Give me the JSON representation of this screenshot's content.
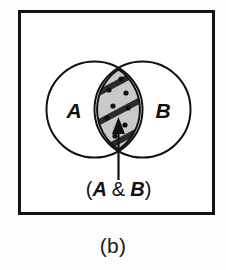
{
  "figure": {
    "caption": "(b)",
    "panel_border_color": "#141414",
    "background_color": "#ffffff"
  },
  "venn": {
    "type": "venn-two-set",
    "left_set": {
      "label": "A",
      "name": "set-a"
    },
    "right_set": {
      "label": "B",
      "name": "set-b"
    },
    "intersection": {
      "label_text": "(A & B)",
      "label_parts": {
        "open_paren": "(",
        "left_operand": "A",
        "operator": "&",
        "right_operand": "B",
        "close_paren": ")"
      },
      "fill_color": "#c9c9c9",
      "hatch_color": "#2b2b2b",
      "dot_color": "#101010",
      "highlighted": true,
      "annotation": "intersection of A and B is shaded"
    },
    "stroke_color": "#111111",
    "arrow": {
      "name": "callout-arrow",
      "color": "#111111",
      "points_to": "intersection"
    }
  }
}
